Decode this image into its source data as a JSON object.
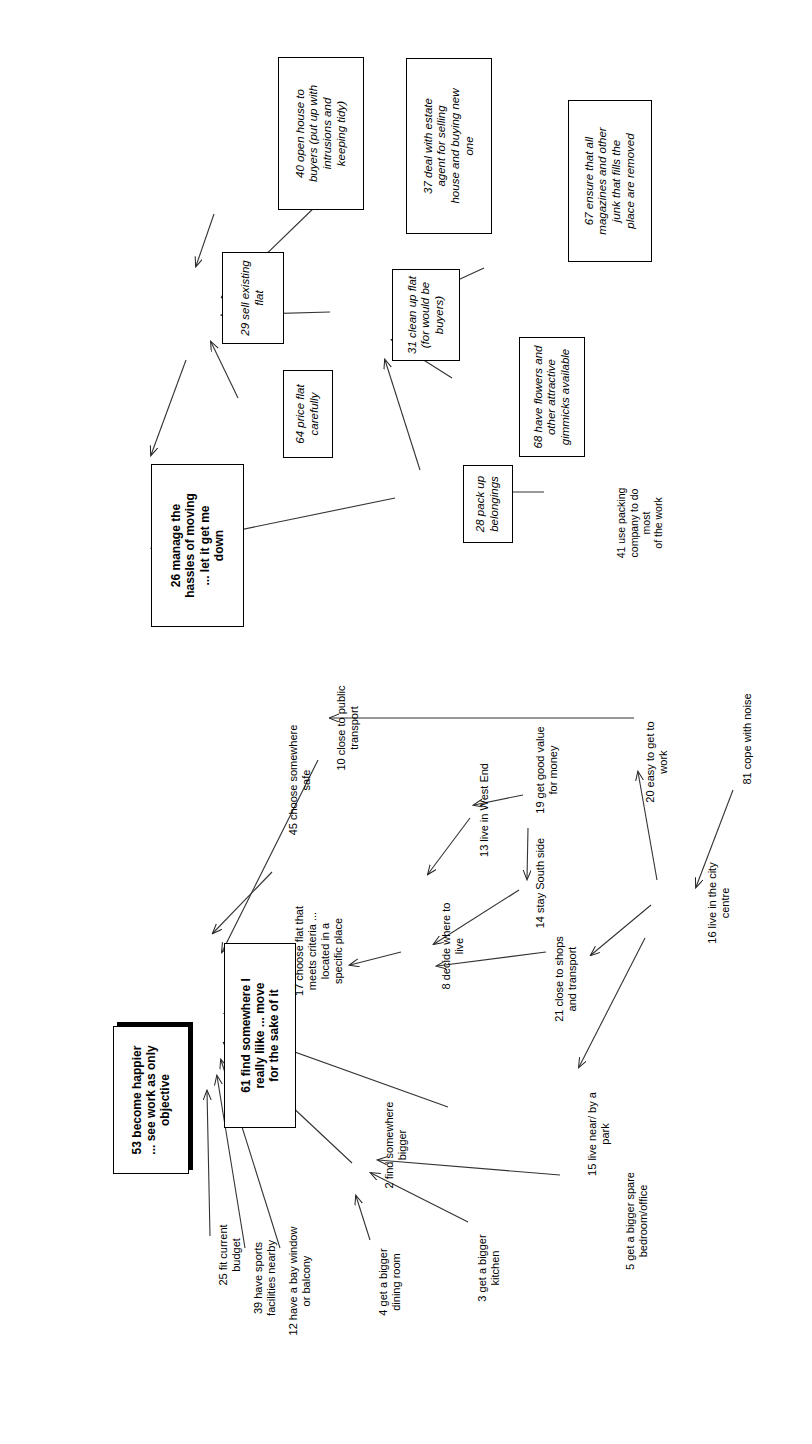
{
  "diagram": {
    "orientation": "text rotated 90 degrees counter-clockwise (landscape page)",
    "clusters": [
      {
        "id": "selling-cluster",
        "name": "managing the move / selling"
      },
      {
        "id": "finding-cluster",
        "name": "finding somewhere to live"
      }
    ],
    "nodes": [
      {
        "id": "n40",
        "num": "40",
        "label": "40 open house to\nbuyers (put up with\nintrusions and\nkeeping tidy)",
        "style": "boxed-italic",
        "cluster": "selling-cluster"
      },
      {
        "id": "n37",
        "num": "37",
        "label": "37 deal with estate\nagent for selling\nhouse and buying new\none",
        "style": "boxed-italic",
        "cluster": "selling-cluster"
      },
      {
        "id": "n67",
        "num": "67",
        "label": "67 ensure that all\nmagazines and other\njunk that fills the\nplace are removed",
        "style": "boxed-italic",
        "cluster": "selling-cluster"
      },
      {
        "id": "n29",
        "num": "29",
        "label": "29 sell existing\nflat",
        "style": "boxed-italic",
        "cluster": "selling-cluster"
      },
      {
        "id": "n31",
        "num": "31",
        "label": "31 clean up flat\n(for would be\nbuyers)",
        "style": "boxed-italic",
        "cluster": "selling-cluster"
      },
      {
        "id": "n64",
        "num": "64",
        "label": "64 price flat\ncarefully",
        "style": "boxed-italic",
        "cluster": "selling-cluster"
      },
      {
        "id": "n68",
        "num": "68",
        "label": "68 have flowers and\nother attractive\ngimmicks available",
        "style": "boxed-italic",
        "cluster": "selling-cluster"
      },
      {
        "id": "n28",
        "num": "28",
        "label": "28 pack up\nbelongings",
        "style": "boxed-italic",
        "cluster": "selling-cluster"
      },
      {
        "id": "n41",
        "num": "41",
        "label": "41 use packing\ncompany to do most\nof the work",
        "style": "plain",
        "cluster": "selling-cluster"
      },
      {
        "id": "n26",
        "num": "26",
        "label": "26 manage the\nhassles of moving\n... let it get me\ndown",
        "style": "boxed-bold",
        "cluster": "selling-cluster"
      },
      {
        "id": "n53",
        "num": "53",
        "label": "53 become happier\n... see work as only\nobjective",
        "style": "shadow-bold",
        "cluster": "finding-cluster"
      },
      {
        "id": "n61",
        "num": "61",
        "label": "61 find somewhere I\nreally liike ... move\nfor the sake of it",
        "style": "boxed-bold",
        "cluster": "finding-cluster"
      },
      {
        "id": "n45",
        "num": "45",
        "label": "45 choose somewhere\nsafe",
        "style": "plain",
        "cluster": "finding-cluster"
      },
      {
        "id": "n10",
        "num": "10",
        "label": "10 close to public\ntransport",
        "style": "plain",
        "cluster": "finding-cluster"
      },
      {
        "id": "n13",
        "num": "13",
        "label": "13 live in West End",
        "style": "plain",
        "cluster": "finding-cluster"
      },
      {
        "id": "n19",
        "num": "19",
        "label": "19 get good value\nfor money",
        "style": "plain",
        "cluster": "finding-cluster"
      },
      {
        "id": "n20",
        "num": "20",
        "label": "20 easy to get to\nwork",
        "style": "plain",
        "cluster": "finding-cluster"
      },
      {
        "id": "n81",
        "num": "81",
        "label": "81 cope with noise",
        "style": "plain",
        "cluster": "finding-cluster"
      },
      {
        "id": "n14",
        "num": "14",
        "label": "14 stay South side",
        "style": "plain",
        "cluster": "finding-cluster"
      },
      {
        "id": "n16",
        "num": "16",
        "label": "16 live in the city\ncentre",
        "style": "plain",
        "cluster": "finding-cluster"
      },
      {
        "id": "n17",
        "num": "17",
        "label": "17 choose flat that\nmeets criteria ...\nlocated in a\nspecific place",
        "style": "plain",
        "cluster": "finding-cluster"
      },
      {
        "id": "n8",
        "num": "8",
        "label": "8 decide where to\nlive",
        "style": "plain",
        "cluster": "finding-cluster"
      },
      {
        "id": "n21",
        "num": "21",
        "label": "21 close to shops\nand transport",
        "style": "plain",
        "cluster": "finding-cluster"
      },
      {
        "id": "n15",
        "num": "15",
        "label": "15 live near/ by a\npark",
        "style": "plain",
        "cluster": "finding-cluster"
      },
      {
        "id": "n5",
        "num": "5",
        "label": "5 get a bigger spare\nbedroom/office",
        "style": "plain",
        "cluster": "finding-cluster"
      },
      {
        "id": "n2",
        "num": "2",
        "label": "2 find somewhere\nbigger",
        "style": "plain",
        "cluster": "finding-cluster"
      },
      {
        "id": "n3",
        "num": "3",
        "label": "3 get a bigger\nkitchen",
        "style": "plain",
        "cluster": "finding-cluster"
      },
      {
        "id": "n4",
        "num": "4",
        "label": "4 get a bigger\ndining room",
        "style": "plain",
        "cluster": "finding-cluster"
      },
      {
        "id": "n12",
        "num": "12",
        "label": "12 have a bay window\nor balcony",
        "style": "plain",
        "cluster": "finding-cluster"
      },
      {
        "id": "n39",
        "num": "39",
        "label": "39 have sports\nfacilities nearby",
        "style": "plain",
        "cluster": "finding-cluster"
      },
      {
        "id": "n25",
        "num": "25",
        "label": "25 fit current\nbudget",
        "style": "plain",
        "cluster": "finding-cluster"
      }
    ],
    "edges": [
      {
        "from": "n40",
        "to": "n29"
      },
      {
        "from": "n37",
        "to": "n29"
      },
      {
        "from": "n64",
        "to": "n29"
      },
      {
        "from": "n31",
        "to": "n29"
      },
      {
        "from": "n67",
        "to": "n31"
      },
      {
        "from": "n68",
        "to": "n31"
      },
      {
        "from": "n28",
        "to": "n31"
      },
      {
        "from": "n41",
        "to": "n28"
      },
      {
        "from": "n29",
        "to": "n26"
      },
      {
        "from": "n28",
        "to": "n26"
      },
      {
        "from": "n61",
        "to": "n53"
      },
      {
        "from": "n45",
        "to": "n61"
      },
      {
        "from": "n10",
        "to": "n61"
      },
      {
        "from": "n17",
        "to": "n61"
      },
      {
        "from": "n2",
        "to": "n61"
      },
      {
        "from": "n12",
        "to": "n61"
      },
      {
        "from": "n39",
        "to": "n61"
      },
      {
        "from": "n25",
        "to": "n61"
      },
      {
        "from": "n15",
        "to": "n61"
      },
      {
        "from": "n20",
        "to": "n10"
      },
      {
        "from": "n19",
        "to": "n13"
      },
      {
        "from": "n19",
        "to": "n14"
      },
      {
        "from": "n13",
        "to": "n8"
      },
      {
        "from": "n14",
        "to": "n8"
      },
      {
        "from": "n21",
        "to": "n8"
      },
      {
        "from": "n8",
        "to": "n17"
      },
      {
        "from": "n16",
        "to": "n21"
      },
      {
        "from": "n16",
        "to": "n20"
      },
      {
        "from": "n16",
        "to": "n15"
      },
      {
        "from": "n81",
        "to": "n16"
      },
      {
        "from": "n5",
        "to": "n2"
      },
      {
        "from": "n3",
        "to": "n2"
      },
      {
        "from": "n4",
        "to": "n2"
      }
    ]
  }
}
